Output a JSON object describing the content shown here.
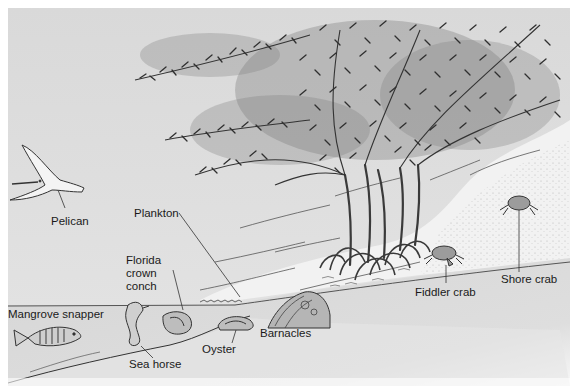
{
  "diagram": {
    "type": "illustration",
    "colors": {
      "sky": "#dcdcdc",
      "water": "#d4d4d4",
      "sand": "#efefef",
      "ink": "#2a2a2a",
      "foliage": "#444444"
    },
    "labels": {
      "pelican": "Pelican",
      "plankton": "Plankton",
      "florida_crown_conch": "Florida\ncrown\nconch",
      "mangrove_snapper": "Mangrove snapper",
      "sea_horse": "Sea horse",
      "oyster": "Oyster",
      "barnacles": "Barnacles",
      "fiddler_crab": "Fiddler crab",
      "shore_crab": "Shore crab"
    }
  }
}
